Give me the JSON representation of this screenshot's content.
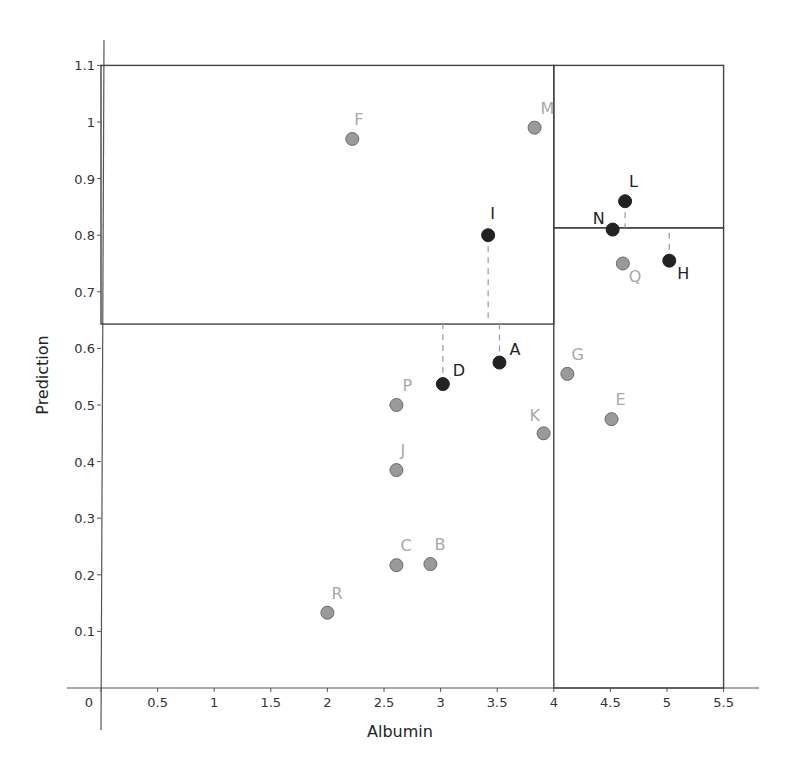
{
  "chart_data": {
    "type": "scatter",
    "title": "",
    "xlabel": "Albumin",
    "ylabel": "Prediction",
    "xlim": [
      0,
      5.5
    ],
    "ylim": [
      0,
      1.1
    ],
    "grid": false,
    "legend": null,
    "x_ticks": [
      "0",
      "0.5",
      "1",
      "1.5",
      "2",
      "2.5",
      "3",
      "3.5",
      "4",
      "4.5",
      "5",
      "5.5"
    ],
    "y_ticks": [
      "0.1",
      "0.2",
      "0.3",
      "0.4",
      "0.5",
      "0.6",
      "0.7",
      "0.8",
      "0.9",
      "1",
      "1.1"
    ],
    "series": [
      {
        "name": "highlighted",
        "color": "#222222",
        "points": [
          {
            "label": "I",
            "x": 3.42,
            "y": 0.8
          },
          {
            "label": "L",
            "x": 4.63,
            "y": 0.86
          },
          {
            "label": "N",
            "x": 4.52,
            "y": 0.81
          },
          {
            "label": "H",
            "x": 5.02,
            "y": 0.755
          },
          {
            "label": "A",
            "x": 3.52,
            "y": 0.575
          },
          {
            "label": "D",
            "x": 3.02,
            "y": 0.537
          }
        ]
      },
      {
        "name": "other",
        "color": "#9a9a9a",
        "points": [
          {
            "label": "F",
            "x": 2.22,
            "y": 0.97
          },
          {
            "label": "M",
            "x": 3.83,
            "y": 0.99
          },
          {
            "label": "Q",
            "x": 4.61,
            "y": 0.75
          },
          {
            "label": "G",
            "x": 4.12,
            "y": 0.555
          },
          {
            "label": "P",
            "x": 2.61,
            "y": 0.5
          },
          {
            "label": "E",
            "x": 4.51,
            "y": 0.475
          },
          {
            "label": "K",
            "x": 3.91,
            "y": 0.45
          },
          {
            "label": "J",
            "x": 2.61,
            "y": 0.385
          },
          {
            "label": "C",
            "x": 2.61,
            "y": 0.217
          },
          {
            "label": "B",
            "x": 2.91,
            "y": 0.219
          },
          {
            "label": "R",
            "x": 2.0,
            "y": 0.133
          }
        ]
      }
    ],
    "regions": [
      {
        "name": "left",
        "x0": 0,
        "x1": 4.0,
        "y0": 0.643,
        "y1": 1.1
      },
      {
        "name": "right-upper",
        "x0": 4.0,
        "x1": 5.5,
        "y0": 0.813,
        "y1": 1.1
      },
      {
        "name": "right-lower",
        "x0": 4.0,
        "x1": 5.5,
        "y0": 0,
        "y1": 0.813
      }
    ],
    "residual_lines": [
      {
        "label": "I",
        "x": 3.42,
        "from": 0.8,
        "to": 0.643
      },
      {
        "label": "A",
        "x": 3.52,
        "from": 0.575,
        "to": 0.643
      },
      {
        "label": "D",
        "x": 3.02,
        "from": 0.537,
        "to": 0.643
      },
      {
        "label": "L",
        "x": 4.63,
        "from": 0.86,
        "to": 0.813
      },
      {
        "label": "H",
        "x": 5.02,
        "from": 0.755,
        "to": 0.813
      }
    ]
  },
  "labels": {
    "xlabel": "Albumin",
    "ylabel": "Prediction"
  },
  "colors": {
    "axis": "#555555",
    "boundary": "#444444",
    "dot_dark": "#222222",
    "dot_gray_fill": "#9a9a9a",
    "dot_gray_stroke": "#6a6a6a",
    "label_dark": "#222222",
    "label_gray": "#a8a8a8",
    "dash": "#9a9a9a"
  }
}
